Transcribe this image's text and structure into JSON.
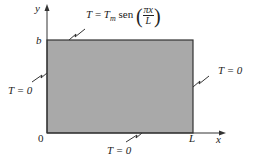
{
  "diagram": {
    "axes": {
      "y_label": "y",
      "x_label": "x",
      "origin_label": "0",
      "y_tick_label": "b",
      "x_tick_label": "L"
    },
    "plate": {
      "fill_color": "#a9a9a9",
      "border_color": "#333333"
    },
    "boundary_conditions": {
      "top": {
        "lhs": "T",
        "eq": " = ",
        "rhs_T": "T",
        "rhs_sub": "m",
        "func": " sen ",
        "frac_num": "πx",
        "frac_den": "L"
      },
      "left": "T = 0",
      "right": "T = 0",
      "bottom": "T = 0"
    }
  }
}
